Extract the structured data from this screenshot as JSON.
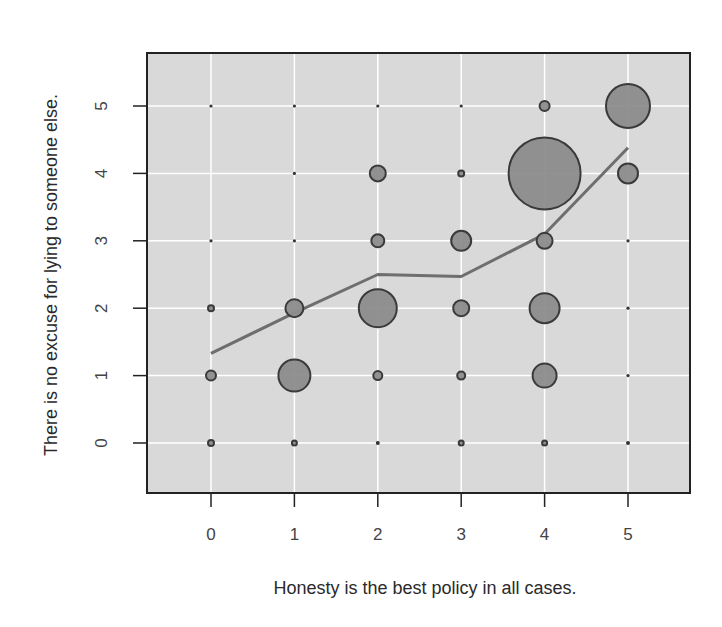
{
  "chart_data": {
    "type": "scatter",
    "subtype": "bubble-with-smoother",
    "title": "",
    "xlabel": "Honesty is the best policy in all cases.",
    "ylabel": "There is no excuse for lying to someone else.",
    "xticks": [
      "0",
      "1",
      "2",
      "3",
      "4",
      "5"
    ],
    "yticks": [
      "0",
      "1",
      "2",
      "3",
      "4",
      "5"
    ],
    "xlim": [
      -0.78,
      5.75
    ],
    "ylim": [
      -0.75,
      5.75
    ],
    "grid": true,
    "legend": null,
    "colors": {
      "panel_background": "#d9d9d9",
      "gridline": "#ffffff",
      "bubble_fill": "#8c8c8c",
      "bubble_stroke": "#3a3a3a",
      "smoother_line": "#6e6e6e",
      "frame": "#222222"
    },
    "points": [
      {
        "x": 0,
        "y": 5,
        "size": 1
      },
      {
        "x": 1,
        "y": 5,
        "size": 1.5
      },
      {
        "x": 2,
        "y": 5,
        "size": 1
      },
      {
        "x": 3,
        "y": 5,
        "size": 1
      },
      {
        "x": 4,
        "y": 5,
        "size": 5
      },
      {
        "x": 5,
        "y": 5,
        "size": 22
      },
      {
        "x": 1,
        "y": 4,
        "size": 1.5
      },
      {
        "x": 2,
        "y": 4,
        "size": 8
      },
      {
        "x": 3,
        "y": 4,
        "size": 3
      },
      {
        "x": 4,
        "y": 4,
        "size": 36
      },
      {
        "x": 5,
        "y": 4,
        "size": 10
      },
      {
        "x": 0,
        "y": 3,
        "size": 1.5
      },
      {
        "x": 1,
        "y": 3,
        "size": 1
      },
      {
        "x": 2,
        "y": 3,
        "size": 6.5
      },
      {
        "x": 3,
        "y": 3,
        "size": 10
      },
      {
        "x": 4,
        "y": 3,
        "size": 8
      },
      {
        "x": 5,
        "y": 3,
        "size": 1.5
      },
      {
        "x": 0,
        "y": 2,
        "size": 3
      },
      {
        "x": 1,
        "y": 2,
        "size": 9
      },
      {
        "x": 2,
        "y": 2,
        "size": 19
      },
      {
        "x": 3,
        "y": 2,
        "size": 8
      },
      {
        "x": 4,
        "y": 2,
        "size": 15
      },
      {
        "x": 5,
        "y": 2,
        "size": 1.5
      },
      {
        "x": 0,
        "y": 1,
        "size": 5
      },
      {
        "x": 1,
        "y": 1,
        "size": 16
      },
      {
        "x": 2,
        "y": 1,
        "size": 4.5
      },
      {
        "x": 3,
        "y": 1,
        "size": 4
      },
      {
        "x": 4,
        "y": 1,
        "size": 12
      },
      {
        "x": 5,
        "y": 1,
        "size": 1.5
      },
      {
        "x": 0,
        "y": 0,
        "size": 3
      },
      {
        "x": 1,
        "y": 0,
        "size": 2.5
      },
      {
        "x": 2,
        "y": 0,
        "size": 2
      },
      {
        "x": 3,
        "y": 0,
        "size": 2.5
      },
      {
        "x": 4,
        "y": 0,
        "size": 2.5
      },
      {
        "x": 5,
        "y": 0,
        "size": 2
      }
    ],
    "series": [
      {
        "name": "smoother",
        "type": "line",
        "x": [
          0,
          1,
          2,
          3,
          4,
          5
        ],
        "values": [
          1.33,
          1.93,
          2.5,
          2.47,
          3.1,
          4.38
        ]
      }
    ]
  }
}
